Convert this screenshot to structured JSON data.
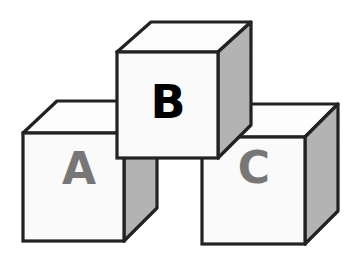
{
  "diagram": {
    "type": "stacked-blocks",
    "colors": {
      "stroke": "#222222",
      "front_face": "#fafafa",
      "top_face": "#fdfdfd",
      "side_face": "#b3b3b3",
      "background": "#ffffff"
    },
    "blocks": [
      {
        "id": "A",
        "label": "A",
        "label_color": "#777777",
        "position": "bottom-left"
      },
      {
        "id": "C",
        "label": "C",
        "label_color": "#777777",
        "position": "bottom-right"
      },
      {
        "id": "B",
        "label": "B",
        "label_color": "#000000",
        "position": "top-center"
      }
    ]
  }
}
